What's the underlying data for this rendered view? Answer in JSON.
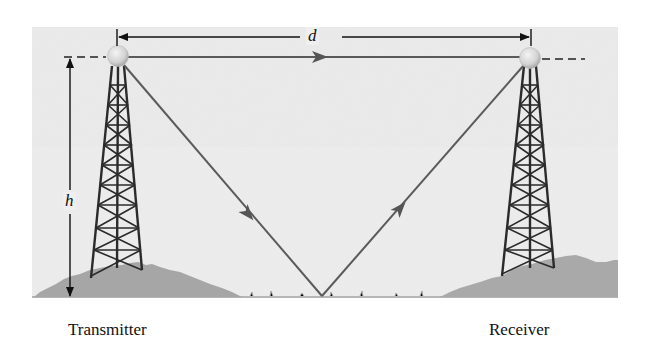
{
  "diagram": {
    "type": "radio-propagation-two-ray",
    "background_color": "#ededed",
    "ground_color": "#a9a9a9",
    "tower_color": "#2b2b2b",
    "ray_color": "#555555",
    "ball_color": "#d9d9d9",
    "labels": {
      "distance": "d",
      "height": "h",
      "transmitter": "Transmitter",
      "receiver": "Receiver"
    },
    "nodes": [
      {
        "id": "transmitter",
        "label": "Transmitter",
        "antenna": {
          "x": 118,
          "y": 57
        }
      },
      {
        "id": "receiver",
        "label": "Receiver",
        "antenna": {
          "x": 530,
          "y": 57
        }
      },
      {
        "id": "reflection-point",
        "x": 322,
        "y": 296
      }
    ],
    "rays": [
      {
        "id": "direct-ray",
        "from": "transmitter",
        "to": "receiver",
        "arrow": "forward"
      },
      {
        "id": "incident-ray",
        "from": "transmitter",
        "to": "reflection-point",
        "arrow": "forward"
      },
      {
        "id": "reflected-ray",
        "from": "reflection-point",
        "to": "receiver",
        "arrow": "forward"
      }
    ],
    "dimensions": [
      {
        "id": "distance-d",
        "label": "d",
        "between": [
          "transmitter",
          "receiver"
        ]
      },
      {
        "id": "height-h",
        "label": "h",
        "between": [
          "transmitter-antenna",
          "ground"
        ]
      }
    ]
  }
}
